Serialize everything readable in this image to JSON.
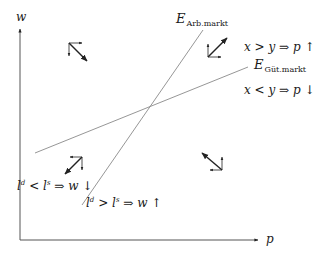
{
  "diagram": {
    "axes": {
      "y_label": "w",
      "x_label": "p"
    },
    "curves": [
      {
        "id": "arbeitsmarkt",
        "label_main": "E",
        "label_sub": "Arb.markt",
        "from": [
          82,
          205
        ],
        "to": [
          203,
          30
        ]
      },
      {
        "id": "guetermarkt",
        "label_main": "E",
        "label_sub": "Güt.markt",
        "from": [
          35,
          153
        ],
        "to": [
          248,
          67
        ]
      }
    ],
    "conditions": {
      "goods_excess": {
        "lhs": "x > y",
        "arrow": "⇒",
        "rhs": "p",
        "direction": "↑"
      },
      "goods_shortage": {
        "lhs": "x < y",
        "arrow": "⇒",
        "rhs": "p",
        "direction": "↓"
      },
      "labor_excess_supply": {
        "l1": "l",
        "s1": "d",
        "op": "<",
        "l2": "l",
        "s2": "s",
        "arrow": "⇒",
        "rhs": "w",
        "direction": "↓"
      },
      "labor_excess_demand": {
        "l1": "l",
        "s1": "d",
        "op": ">",
        "l2": "l",
        "s2": "s",
        "arrow": "⇒",
        "rhs": "w",
        "direction": "↑"
      }
    },
    "colors": {
      "axis": "#555555",
      "curve": "#8a8a8a",
      "arrow": "#222222",
      "text": "#1a1a1a"
    }
  }
}
